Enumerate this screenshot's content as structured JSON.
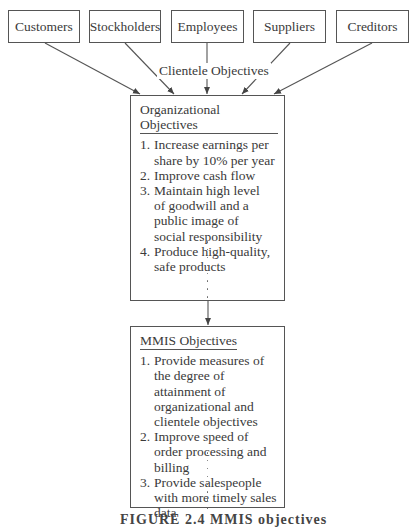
{
  "diagram": {
    "clientele_groups": [
      {
        "label": "Customers"
      },
      {
        "label": "Stockholders"
      },
      {
        "label": "Employees"
      },
      {
        "label": "Suppliers"
      },
      {
        "label": "Creditors"
      }
    ],
    "edge_label": "Clientele Objectives",
    "organizational": {
      "title": "Organizational Objectives",
      "items": [
        {
          "num": "1.",
          "text": "Increase earnings per share by 10% per year"
        },
        {
          "num": "2.",
          "text": "Improve cash flow"
        },
        {
          "num": "3.",
          "text": "Maintain high level of goodwill and a public image of social responsibility"
        },
        {
          "num": "4.",
          "text": "Produce high-quality, safe products"
        }
      ]
    },
    "mmis": {
      "title": "MMIS Objectives",
      "items": [
        {
          "num": "1.",
          "text": "Provide measures of the degree of attainment of organizational and clientele objectives"
        },
        {
          "num": "2.",
          "text": "Improve speed of order processing and billing"
        },
        {
          "num": "3.",
          "text": "Provide salespeople with more timely sales data"
        }
      ]
    },
    "caption": "FIGURE 2.4 MMIS objectives"
  }
}
